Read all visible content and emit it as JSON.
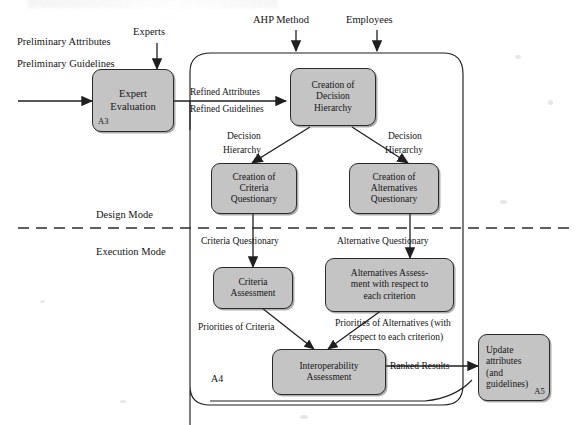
{
  "diagram": {
    "type": "flowchart",
    "colors": {
      "box_fill": "#c4c4c4",
      "box_stroke": "#2b2b2b",
      "line": "#1f1f1f",
      "background": "#ffffff",
      "mode_divider": "#2b2b2b"
    }
  },
  "boxes": [
    {
      "id": "expert_evaluation",
      "label": "Expert\nEvaluation",
      "line1": "Expert",
      "line2": "Evaluation",
      "code": "A3"
    },
    {
      "id": "decision_hierarchy",
      "label": "Creation of\nDecision\nHierarchy",
      "line1": "Creation of",
      "line2": "Decision",
      "line3": "Hierarchy",
      "code": ""
    },
    {
      "id": "criteria_questionary",
      "label": "Creation of\nCriteria\nQuestionary",
      "line1": "Creation of",
      "line2": "Criteria",
      "line3": "Questionary",
      "code": ""
    },
    {
      "id": "alternatives_questionary",
      "label": "Creation of\nAlternatives\nQuestionary",
      "line1": "Creation of",
      "line2": "Alternatives",
      "line3": "Questionary",
      "code": ""
    },
    {
      "id": "criteria_assessment",
      "label": "Criteria\nAssessment",
      "line1": "Criteria",
      "line2": "Assessment",
      "code": ""
    },
    {
      "id": "alternatives_assessment",
      "label": "Alternatives Assess-\nment with respect to\neach criterion",
      "line1": "Alternatives Assess-",
      "line2": "ment with respect to",
      "line3": "each criterion",
      "code": ""
    },
    {
      "id": "interoperability_assessment",
      "label": "Interoperability\nAssessment",
      "line1": "Interoperability",
      "line2": "Assessment",
      "code": ""
    },
    {
      "id": "update_attributes",
      "label": "Update attributes (and guidelines)",
      "line1": "Update",
      "line2": "attributes",
      "line3": "(and",
      "line4": "guidelines)",
      "code": "A5"
    }
  ],
  "inputs": {
    "preliminary_attributes": "Preliminary Attributes",
    "preliminary_guidelines": "Preliminary Guidelines",
    "experts": "Experts",
    "ahp_method": "AHP Method",
    "employees": "Employees"
  },
  "flow_labels": {
    "refined_attributes": "Refined Attributes",
    "refined_guidelines": "Refined Guidelines",
    "decision_hierarchy_left_l1": "Decision",
    "decision_hierarchy_left_l2": "Hierarchy",
    "decision_hierarchy_right_l1": "Decision",
    "decision_hierarchy_right_l2": "Hierarchy",
    "criteria_questionary_flow": "Criteria Questionary",
    "alternative_questionary_flow": "Alternative Questionary",
    "priorities_of_criteria": "Priorities of Criteria",
    "priorities_of_alternatives_l1": "Priorities of Alternatives (with",
    "priorities_of_alternatives_l2": "respect to each criterion)",
    "ranked_results": "Ranked Results"
  },
  "modes": {
    "design": "Design Mode",
    "execution": "Execution Mode"
  },
  "container": {
    "code": "A4"
  }
}
